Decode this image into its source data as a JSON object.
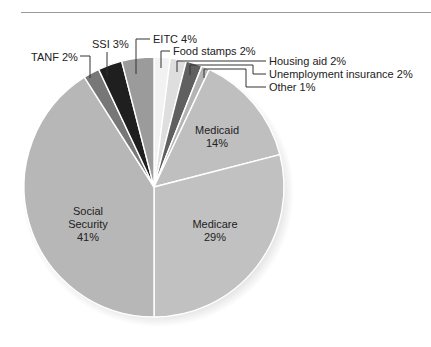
{
  "chart_data": {
    "type": "pie",
    "title": "",
    "start_angle_deg": 0,
    "direction": "clockwise",
    "slices": [
      {
        "name": "Food stamps",
        "value": 2,
        "label": "Food stamps 2%",
        "color": "#f2f2f2",
        "label_style": "callout"
      },
      {
        "name": "Housing aid",
        "value": 2,
        "label": "Housing aid 2%",
        "color": "#dedede",
        "label_style": "callout"
      },
      {
        "name": "Unemployment insurance",
        "value": 2,
        "label": "Unemployment insurance 2%",
        "color": "#606060",
        "label_style": "callout"
      },
      {
        "name": "Other",
        "value": 1,
        "label": "Other 1%",
        "color": "#b4b4b4",
        "label_style": "callout"
      },
      {
        "name": "Medicaid",
        "value": 14,
        "label": "Medicaid\n14%",
        "color": "#bfbfbf",
        "label_style": "inside"
      },
      {
        "name": "Medicare",
        "value": 29,
        "label": "Medicare\n29%",
        "color": "#c1c1c1",
        "label_style": "inside"
      },
      {
        "name": "Social Security",
        "value": 41,
        "label": "Social\nSecurity\n41%",
        "color": "#b7b7b7",
        "label_style": "inside"
      },
      {
        "name": "TANF",
        "value": 2,
        "label": "TANF 2%",
        "color": "#777777",
        "label_style": "callout"
      },
      {
        "name": "SSI",
        "value": 3,
        "label": "SSI 3%",
        "color": "#1f1f1f",
        "label_style": "callout"
      },
      {
        "name": "EITC",
        "value": 4,
        "label": "EITC 4%",
        "color": "#9b9b9b",
        "label_style": "callout"
      }
    ],
    "unit": "%",
    "legend": "none (direct labels)"
  },
  "layout": {
    "center": [
      154,
      187
    ],
    "radius": 130,
    "separator_color": "#ffffff"
  },
  "inside_labels": [
    {
      "slice": "Medicaid",
      "lines": [
        "Medicaid",
        "14%"
      ],
      "x": 217,
      "y": 134
    },
    {
      "slice": "Medicare",
      "lines": [
        "Medicare",
        "29%"
      ],
      "x": 215,
      "y": 228
    },
    {
      "slice": "Social Security",
      "lines": [
        "Social",
        "Security",
        "41%"
      ],
      "x": 88,
      "y": 215
    }
  ],
  "callouts": [
    {
      "slice": "TANF",
      "text": "TANF 2%",
      "tx": 31,
      "ty": 61,
      "anchor": "start",
      "path": [
        [
          80,
          56
        ],
        [
          90,
          56
        ],
        [
          90,
          78
        ]
      ]
    },
    {
      "slice": "SSI",
      "text": "SSI 3%",
      "tx": 92,
      "ty": 48,
      "anchor": "start",
      "path": [
        [
          107,
          52
        ],
        [
          107,
          76
        ]
      ]
    },
    {
      "slice": "EITC",
      "text": "EITC 4%",
      "tx": 153,
      "ty": 43,
      "anchor": "start",
      "path": [
        [
          150,
          39
        ],
        [
          136,
          39
        ],
        [
          136,
          74
        ]
      ]
    },
    {
      "slice": "Food stamps",
      "text": "Food stamps 2%",
      "tx": 173,
      "ty": 55,
      "anchor": "start",
      "path": [
        [
          170,
          51
        ],
        [
          161,
          51
        ],
        [
          161,
          68
        ]
      ]
    },
    {
      "slice": "Housing aid",
      "text": "Housing aid 2%",
      "tx": 269,
      "ty": 65,
      "anchor": "start",
      "path": [
        [
          177,
          72
        ],
        [
          177,
          61
        ],
        [
          266,
          61
        ]
      ]
    },
    {
      "slice": "Unemployment insurance",
      "text": "Unemployment insurance 2%",
      "tx": 269,
      "ty": 78,
      "anchor": "start",
      "path": [
        [
          190,
          75
        ],
        [
          190,
          65
        ],
        [
          253,
          65
        ],
        [
          253,
          74
        ],
        [
          266,
          74
        ]
      ]
    },
    {
      "slice": "Other",
      "text": "Other 1%",
      "tx": 269,
      "ty": 91,
      "anchor": "start",
      "path": [
        [
          204,
          78
        ],
        [
          204,
          69
        ],
        [
          246,
          69
        ],
        [
          246,
          87
        ],
        [
          266,
          87
        ]
      ]
    }
  ]
}
